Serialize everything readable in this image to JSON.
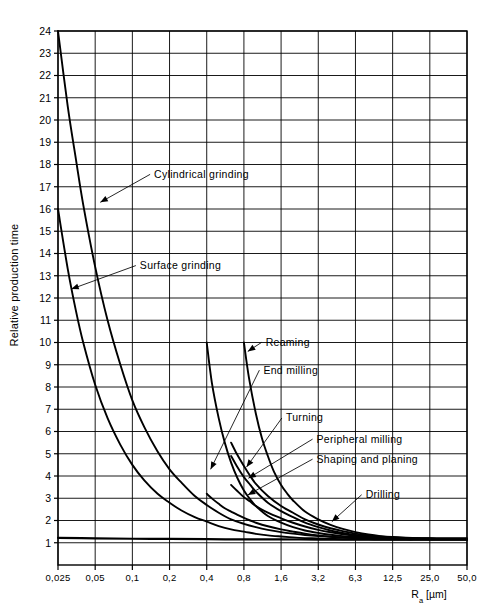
{
  "chart_data": {
    "type": "line",
    "title": "",
    "xlabel": "Ra [µm]",
    "ylabel": "Relative production time",
    "xscale": "log",
    "grid": true,
    "legend": "inline-annotations",
    "x_tick_labels": [
      "0,025",
      "0,05",
      "0,1",
      "0,2",
      "0,4",
      "0,8",
      "1,6",
      "3,2",
      "6,3",
      "12,5",
      "25,0",
      "50,0"
    ],
    "x_tick_values": [
      0.025,
      0.05,
      0.1,
      0.2,
      0.4,
      0.8,
      1.6,
      3.2,
      6.3,
      12.5,
      25.0,
      50.0
    ],
    "y_tick_labels": [
      "1",
      "2",
      "3",
      "4",
      "5",
      "6",
      "7",
      "8",
      "9",
      "10",
      "11",
      "12",
      "13",
      "14",
      "15",
      "16",
      "17",
      "18",
      "19",
      "20",
      "21",
      "22",
      "23",
      "24"
    ],
    "ylim": [
      0,
      24
    ],
    "xlim": [
      0.025,
      50.0
    ],
    "series": [
      {
        "name": "Cylindrical grinding",
        "label_x": 0.15,
        "label_y": 17.4,
        "arrow_to_x": 0.055,
        "arrow_to_y": 16.3,
        "points": [
          [
            0.025,
            24.0
          ],
          [
            0.03,
            20.6
          ],
          [
            0.035,
            18.2
          ],
          [
            0.04,
            16.2
          ],
          [
            0.05,
            13.4
          ],
          [
            0.063,
            11.0
          ],
          [
            0.08,
            9.0
          ],
          [
            0.1,
            7.4
          ],
          [
            0.125,
            6.2
          ],
          [
            0.16,
            5.1
          ],
          [
            0.2,
            4.3
          ],
          [
            0.25,
            3.7
          ],
          [
            0.32,
            3.1
          ],
          [
            0.4,
            2.7
          ],
          [
            0.5,
            2.35
          ],
          [
            0.63,
            2.05
          ],
          [
            0.8,
            1.85
          ],
          [
            1.0,
            1.7
          ],
          [
            1.25,
            1.58
          ],
          [
            1.6,
            1.48
          ],
          [
            2.0,
            1.41
          ],
          [
            2.5,
            1.35
          ],
          [
            3.2,
            1.3
          ],
          [
            4.0,
            1.27
          ],
          [
            5.0,
            1.24
          ],
          [
            6.3,
            1.22
          ],
          [
            8.0,
            1.2
          ],
          [
            10.0,
            1.19
          ],
          [
            12.5,
            1.18
          ],
          [
            16.0,
            1.17
          ],
          [
            20.0,
            1.17
          ],
          [
            25.0,
            1.16
          ],
          [
            32.0,
            1.16
          ],
          [
            40.0,
            1.16
          ],
          [
            50.0,
            1.16
          ]
        ]
      },
      {
        "name": "Surface grinding",
        "label_x": 0.115,
        "label_y": 13.3,
        "arrow_to_x": 0.032,
        "arrow_to_y": 12.4,
        "points": [
          [
            0.025,
            16.0
          ],
          [
            0.03,
            13.3
          ],
          [
            0.035,
            11.4
          ],
          [
            0.04,
            10.0
          ],
          [
            0.05,
            8.1
          ],
          [
            0.063,
            6.6
          ],
          [
            0.08,
            5.4
          ],
          [
            0.1,
            4.5
          ],
          [
            0.125,
            3.8
          ],
          [
            0.16,
            3.2
          ],
          [
            0.2,
            2.8
          ],
          [
            0.25,
            2.45
          ],
          [
            0.32,
            2.15
          ],
          [
            0.4,
            1.95
          ],
          [
            0.5,
            1.75
          ],
          [
            0.63,
            1.6
          ],
          [
            0.8,
            1.5
          ],
          [
            1.0,
            1.4
          ],
          [
            1.25,
            1.33
          ],
          [
            1.6,
            1.28
          ],
          [
            2.0,
            1.24
          ],
          [
            2.5,
            1.21
          ],
          [
            3.2,
            1.19
          ],
          [
            4.0,
            1.17
          ],
          [
            5.0,
            1.16
          ],
          [
            6.3,
            1.15
          ],
          [
            8.0,
            1.15
          ],
          [
            10.0,
            1.14
          ],
          [
            12.5,
            1.14
          ],
          [
            16.0,
            1.14
          ],
          [
            20.0,
            1.14
          ],
          [
            25.0,
            1.14
          ],
          [
            32.0,
            1.14
          ],
          [
            40.0,
            1.14
          ],
          [
            50.0,
            1.14
          ]
        ]
      },
      {
        "name": "End milling",
        "label_x": 1.15,
        "label_y": 8.6,
        "arrow_to_x": 0.43,
        "arrow_to_y": 4.3,
        "points": [
          [
            0.4,
            10.0
          ],
          [
            0.44,
            8.2
          ],
          [
            0.5,
            6.6
          ],
          [
            0.56,
            5.5
          ],
          [
            0.63,
            4.6
          ],
          [
            0.71,
            3.9
          ],
          [
            0.8,
            3.35
          ],
          [
            0.9,
            2.95
          ],
          [
            1.0,
            2.65
          ],
          [
            1.25,
            2.2
          ],
          [
            1.6,
            1.9
          ],
          [
            2.0,
            1.7
          ],
          [
            2.5,
            1.55
          ],
          [
            3.2,
            1.44
          ],
          [
            4.0,
            1.36
          ],
          [
            5.0,
            1.3
          ],
          [
            6.3,
            1.26
          ],
          [
            8.0,
            1.23
          ],
          [
            10.0,
            1.21
          ],
          [
            12.5,
            1.2
          ],
          [
            16.0,
            1.19
          ],
          [
            20.0,
            1.18
          ],
          [
            25.0,
            1.18
          ],
          [
            32.0,
            1.18
          ],
          [
            40.0,
            1.18
          ],
          [
            50.0,
            1.18
          ]
        ]
      },
      {
        "name": "Reaming",
        "label_x": 1.2,
        "label_y": 9.85,
        "arrow_to_x": 0.86,
        "arrow_to_y": 9.6,
        "points": [
          [
            0.8,
            10.0
          ],
          [
            0.88,
            8.4
          ],
          [
            1.0,
            6.8
          ],
          [
            1.12,
            5.7
          ],
          [
            1.25,
            4.9
          ],
          [
            1.4,
            4.2
          ],
          [
            1.6,
            3.6
          ],
          [
            1.8,
            3.2
          ],
          [
            2.0,
            2.9
          ],
          [
            2.5,
            2.4
          ],
          [
            3.2,
            2.05
          ],
          [
            4.0,
            1.8
          ],
          [
            5.0,
            1.62
          ],
          [
            6.3,
            1.48
          ],
          [
            8.0,
            1.37
          ],
          [
            10.0,
            1.3
          ],
          [
            12.5,
            1.26
          ],
          [
            16.0,
            1.23
          ],
          [
            20.0,
            1.21
          ],
          [
            25.0,
            1.2
          ],
          [
            32.0,
            1.19
          ],
          [
            40.0,
            1.19
          ],
          [
            50.0,
            1.19
          ]
        ]
      },
      {
        "name": "Turning",
        "label_x": 1.75,
        "label_y": 6.45,
        "arrow_to_x": 0.84,
        "arrow_to_y": 4.4,
        "points": [
          [
            0.63,
            5.5
          ],
          [
            0.7,
            5.0
          ],
          [
            0.8,
            4.45
          ],
          [
            0.9,
            4.0
          ],
          [
            1.0,
            3.65
          ],
          [
            1.25,
            3.1
          ],
          [
            1.6,
            2.65
          ],
          [
            2.0,
            2.35
          ],
          [
            2.5,
            2.05
          ],
          [
            3.2,
            1.82
          ],
          [
            4.0,
            1.65
          ],
          [
            5.0,
            1.52
          ],
          [
            6.3,
            1.41
          ],
          [
            8.0,
            1.33
          ],
          [
            10.0,
            1.28
          ],
          [
            12.5,
            1.24
          ],
          [
            16.0,
            1.21
          ],
          [
            20.0,
            1.2
          ],
          [
            25.0,
            1.19
          ],
          [
            32.0,
            1.18
          ],
          [
            40.0,
            1.18
          ],
          [
            50.0,
            1.18
          ]
        ]
      },
      {
        "name": "Peripheral milling",
        "label_x": 3.1,
        "label_y": 5.5,
        "arrow_to_x": 0.87,
        "arrow_to_y": 3.9,
        "points": [
          [
            0.63,
            4.9
          ],
          [
            0.7,
            4.45
          ],
          [
            0.8,
            3.95
          ],
          [
            0.9,
            3.6
          ],
          [
            1.0,
            3.3
          ],
          [
            1.25,
            2.8
          ],
          [
            1.6,
            2.42
          ],
          [
            2.0,
            2.15
          ],
          [
            2.5,
            1.9
          ],
          [
            3.2,
            1.7
          ],
          [
            4.0,
            1.55
          ],
          [
            5.0,
            1.44
          ],
          [
            6.3,
            1.35
          ],
          [
            8.0,
            1.29
          ],
          [
            10.0,
            1.25
          ],
          [
            12.5,
            1.22
          ],
          [
            16.0,
            1.2
          ],
          [
            20.0,
            1.19
          ],
          [
            25.0,
            1.18
          ],
          [
            32.0,
            1.18
          ],
          [
            40.0,
            1.18
          ],
          [
            50.0,
            1.18
          ]
        ]
      },
      {
        "name": "Shaping and planing",
        "label_x": 3.1,
        "label_y": 4.6,
        "arrow_to_x": 0.86,
        "arrow_to_y": 3.15,
        "points": [
          [
            0.63,
            3.6
          ],
          [
            0.7,
            3.35
          ],
          [
            0.8,
            3.05
          ],
          [
            0.9,
            2.85
          ],
          [
            1.0,
            2.65
          ],
          [
            1.25,
            2.35
          ],
          [
            1.6,
            2.1
          ],
          [
            2.0,
            1.9
          ],
          [
            2.5,
            1.73
          ],
          [
            3.2,
            1.58
          ],
          [
            4.0,
            1.47
          ],
          [
            5.0,
            1.38
          ],
          [
            6.3,
            1.31
          ],
          [
            8.0,
            1.26
          ],
          [
            10.0,
            1.23
          ],
          [
            12.5,
            1.21
          ],
          [
            16.0,
            1.19
          ],
          [
            20.0,
            1.18
          ],
          [
            25.0,
            1.18
          ],
          [
            32.0,
            1.17
          ],
          [
            40.0,
            1.17
          ],
          [
            50.0,
            1.17
          ]
        ]
      },
      {
        "name": "Drilling",
        "label_x": 7.6,
        "label_y": 3.0,
        "arrow_to_x": 4.1,
        "arrow_to_y": 1.95,
        "points": [
          [
            0.4,
            3.2
          ],
          [
            0.45,
            2.95
          ],
          [
            0.5,
            2.75
          ],
          [
            0.56,
            2.55
          ],
          [
            0.63,
            2.4
          ],
          [
            0.71,
            2.25
          ],
          [
            0.8,
            2.12
          ],
          [
            0.9,
            2.0
          ],
          [
            1.0,
            1.9
          ],
          [
            1.25,
            1.74
          ],
          [
            1.6,
            1.6
          ],
          [
            2.0,
            1.5
          ],
          [
            2.5,
            1.41
          ],
          [
            3.2,
            1.33
          ],
          [
            4.0,
            1.27
          ],
          [
            5.0,
            1.23
          ],
          [
            6.3,
            1.2
          ],
          [
            8.0,
            1.18
          ],
          [
            10.0,
            1.17
          ],
          [
            12.5,
            1.16
          ],
          [
            16.0,
            1.15
          ],
          [
            20.0,
            1.15
          ],
          [
            25.0,
            1.15
          ],
          [
            32.0,
            1.15
          ],
          [
            40.0,
            1.15
          ],
          [
            50.0,
            1.15
          ]
        ]
      },
      {
        "name": "baseline",
        "is_baseline": true,
        "points": [
          [
            0.025,
            1.22
          ],
          [
            0.05,
            1.2
          ],
          [
            0.1,
            1.18
          ],
          [
            0.2,
            1.17
          ],
          [
            0.4,
            1.16
          ],
          [
            0.8,
            1.15
          ],
          [
            1.6,
            1.15
          ],
          [
            3.2,
            1.14
          ],
          [
            6.3,
            1.14
          ],
          [
            12.5,
            1.14
          ],
          [
            25.0,
            1.14
          ],
          [
            50.0,
            1.14
          ]
        ]
      }
    ]
  },
  "colors": {
    "curve": "#000000",
    "grid": "#000000",
    "axis": "#000000",
    "background": "#ffffff"
  }
}
